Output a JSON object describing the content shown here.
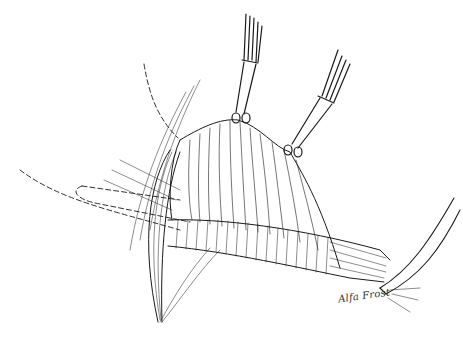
{
  "illustration": {
    "type": "surgical line drawing",
    "background": "#ffffff",
    "ink_color": "#1a1a1a",
    "signature": "Alfa Frost",
    "elements": [
      {
        "name": "forceps-left",
        "tip": [
          238,
          118
        ]
      },
      {
        "name": "forceps-right",
        "tip": [
          292,
          152
        ]
      },
      {
        "name": "retracted-membrane"
      },
      {
        "name": "tubular-structure"
      },
      {
        "name": "muscle-band-left"
      },
      {
        "name": "retractor-right"
      },
      {
        "name": "dashed-outline-upper"
      },
      {
        "name": "dashed-outline-lower"
      }
    ]
  }
}
